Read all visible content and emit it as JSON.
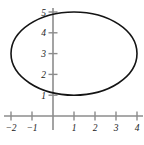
{
  "figure": {
    "title": "",
    "background_color": "#ffffff",
    "width": 144,
    "height": 145
  },
  "chart_data": {
    "type": "scatter",
    "title": "",
    "subtitle": "",
    "xlabel": "",
    "ylabel": "",
    "curve_kind": "ellipse",
    "curve_color": "#141414",
    "curve_line_width": 1.6,
    "grid": false,
    "legend": null,
    "axis_color": "#8c8c8c",
    "axis_line_width": 1.6,
    "tick_color": "#8c8c8c",
    "tick_label_color": "#1a1a1a",
    "xlim": [
      -2.55,
      4.45
    ],
    "ylim": [
      -0.45,
      5.5
    ],
    "x_ticks": [
      -2,
      -1,
      1,
      2,
      3,
      4
    ],
    "y_ticks": [
      1,
      2,
      3,
      4,
      5
    ],
    "x_tick_labels": [
      "−2",
      "−1",
      "1",
      "2",
      "3",
      "4"
    ],
    "y_tick_labels": [
      "1",
      "2",
      "3",
      "4",
      "5"
    ],
    "ellipse": {
      "center_x": 1,
      "center_y": 3,
      "semi_axis_x": 3,
      "semi_axis_y": 2,
      "x_range": [
        -2,
        4
      ],
      "y_range": [
        1,
        5
      ],
      "vertices": [
        {
          "x": -2,
          "y": 3
        },
        {
          "x": 4,
          "y": 3
        },
        {
          "x": 1,
          "y": 5
        },
        {
          "x": 1,
          "y": 1
        }
      ]
    },
    "points": [
      {
        "x": 4.0,
        "y": 3.0
      },
      {
        "x": 3.9,
        "y": 3.51
      },
      {
        "x": 3.6,
        "y": 3.94
      },
      {
        "x": 3.12,
        "y": 4.41
      },
      {
        "x": 2.5,
        "y": 4.73
      },
      {
        "x": 1.78,
        "y": 4.94
      },
      {
        "x": 1.0,
        "y": 5.0
      },
      {
        "x": 0.22,
        "y": 4.94
      },
      {
        "x": -0.5,
        "y": 4.73
      },
      {
        "x": -1.12,
        "y": 4.41
      },
      {
        "x": -1.6,
        "y": 3.94
      },
      {
        "x": -1.9,
        "y": 3.51
      },
      {
        "x": -2.0,
        "y": 3.0
      },
      {
        "x": -1.9,
        "y": 2.49
      },
      {
        "x": -1.6,
        "y": 2.06
      },
      {
        "x": -1.12,
        "y": 1.59
      },
      {
        "x": -0.5,
        "y": 1.27
      },
      {
        "x": 0.22,
        "y": 1.06
      },
      {
        "x": 1.0,
        "y": 1.0
      },
      {
        "x": 1.78,
        "y": 1.06
      },
      {
        "x": 2.5,
        "y": 1.27
      },
      {
        "x": 3.12,
        "y": 1.59
      },
      {
        "x": 3.6,
        "y": 2.06
      },
      {
        "x": 3.9,
        "y": 2.49
      },
      {
        "x": 4.0,
        "y": 3.0
      }
    ]
  },
  "geometry": {
    "origin_px_x": 53,
    "origin_px_y": 116,
    "px_per_unit_x": 21,
    "px_per_unit_y": 20.8,
    "tick_half_length": 4.5,
    "x_axis_start_px": 4,
    "x_axis_end_px": 143,
    "y_axis_top_px": 8,
    "y_axis_bottom_px": 130
  }
}
